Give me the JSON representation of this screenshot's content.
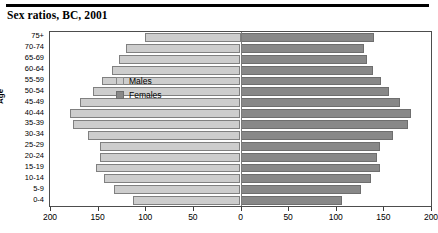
{
  "title": "Sex ratios, BC, 2001",
  "legend": {
    "males_label": "Males",
    "females_label": "Females",
    "male_color": "#cdcdcd",
    "female_color": "#888888"
  },
  "chart_data": {
    "type": "bar",
    "subtype": "population-pyramid",
    "title": "Sex ratios, BC, 2001",
    "xlabel": "",
    "ylabel": "Age",
    "categories": [
      "75+",
      "70-74",
      "65-69",
      "60-64",
      "55-59",
      "50-54",
      "45-49",
      "40-44",
      "35-39",
      "30-34",
      "25-29",
      "20-24",
      "15-19",
      "10-14",
      "5-9",
      "0-4"
    ],
    "series": [
      {
        "name": "Males",
        "direction": "left",
        "color": "#cdcdcd",
        "values": [
          100,
          120,
          128,
          135,
          145,
          155,
          168,
          179,
          176,
          160,
          147,
          148,
          152,
          143,
          133,
          113
        ]
      },
      {
        "name": "Females",
        "direction": "right",
        "color": "#888888",
        "values": [
          140,
          130,
          133,
          139,
          147,
          156,
          167,
          179,
          176,
          160,
          146,
          143,
          146,
          137,
          126,
          107
        ]
      }
    ],
    "xticks": [
      200,
      150,
      100,
      50,
      0,
      50,
      100,
      150,
      200
    ],
    "xlim": [
      -200,
      200
    ],
    "grid": false,
    "legend_position": "top-left"
  }
}
